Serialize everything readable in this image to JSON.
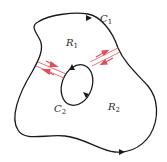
{
  "diagram": {
    "colors": {
      "curve": "#1a1a1a",
      "cut": "#e0505a",
      "text": "#2a2a2a"
    },
    "labels": {
      "c1": {
        "main": "C",
        "sub": "1"
      },
      "c2": {
        "main": "C",
        "sub": "2"
      },
      "r1": {
        "main": "R",
        "sub": "1"
      },
      "r2": {
        "main": "R",
        "sub": "2"
      }
    }
  }
}
